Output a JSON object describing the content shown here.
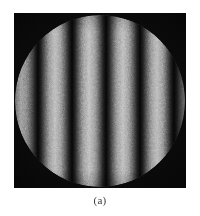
{
  "figure": {
    "caption": "(a)",
    "kind": "interferogram",
    "canvas": {
      "width": 200,
      "height": 216,
      "background": "#ffffff"
    },
    "plate": {
      "left": 14,
      "top": 13,
      "width": 172,
      "height": 175,
      "background": "#050505",
      "corner_color": "#000000"
    },
    "aperture": {
      "shape": "circle",
      "center_x": 100,
      "center_y": 100,
      "width": 170,
      "height": 172
    },
    "fringes": {
      "orientation": "vertical",
      "bright_band_count": 5,
      "period_px": 34,
      "bright_color": "#b4b4b4",
      "dark_color": "#040404",
      "grain": "speckle"
    }
  }
}
